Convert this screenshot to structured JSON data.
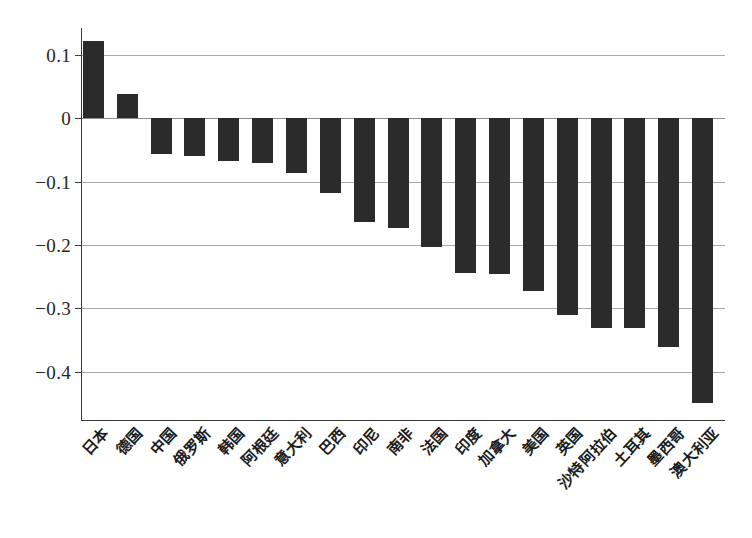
{
  "chart_data": {
    "type": "bar",
    "title": "",
    "subtitle": "",
    "xlabel": "",
    "ylabel": "",
    "categories": [
      "日本",
      "德国",
      "中国",
      "俄罗斯",
      "韩国",
      "阿根廷",
      "意大利",
      "巴西",
      "印尼",
      "南非",
      "法国",
      "印度",
      "加拿大",
      "美国",
      "英国",
      "沙特阿拉伯",
      "土耳其",
      "墨西哥",
      "澳大利亚"
    ],
    "values": [
      0.122,
      0.039,
      -0.057,
      -0.06,
      -0.067,
      -0.07,
      -0.087,
      -0.118,
      -0.164,
      -0.173,
      -0.203,
      -0.244,
      -0.246,
      -0.273,
      -0.311,
      -0.331,
      -0.331,
      -0.362,
      -0.45
    ],
    "yticks": [
      0.1,
      0,
      -0.1,
      -0.2,
      -0.3,
      -0.4
    ],
    "ytick_labels": [
      "0.1",
      "0",
      "−0.1",
      "−0.2",
      "−0.3",
      "−0.4"
    ],
    "ylim": [
      -0.4766,
      0.1426
    ],
    "grid": true,
    "legend": null,
    "bar_color": "#2b2b2b",
    "gridline_color": "#a8a8a8",
    "axis_color": "#3a3a3a"
  }
}
